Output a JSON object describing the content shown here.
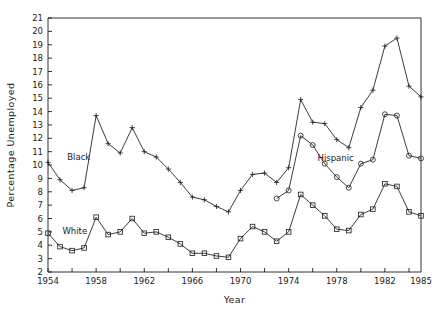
{
  "chart_data": {
    "type": "line",
    "title": "",
    "xlabel": "Year",
    "ylabel": "Percentage  Unemployed",
    "xlim": [
      1954,
      1985
    ],
    "ylim": [
      2,
      21
    ],
    "grid": false,
    "legend_position": "inline-annotations",
    "y_ticks": [
      2,
      3,
      4,
      5,
      6,
      7,
      8,
      9,
      10,
      11,
      12,
      13,
      14,
      15,
      16,
      17,
      18,
      19,
      20,
      21
    ],
    "x_ticks": [
      1954,
      1956,
      1958,
      1960,
      1962,
      1964,
      1966,
      1968,
      1970,
      1972,
      1974,
      1976,
      1978,
      1980,
      1982,
      1984
    ],
    "x_tick_labels": [
      "1954",
      "",
      "1958",
      "",
      "1962",
      "",
      "1966",
      "",
      "1970",
      "",
      "1974",
      "",
      "1978",
      "",
      "1982",
      ""
    ],
    "x_extra_labels": [
      {
        "x": 1985,
        "label": "1985"
      }
    ],
    "annotations": [
      {
        "text": "Black",
        "x": 1955.6,
        "y": 10.6
      },
      {
        "text": "White",
        "x": 1955.2,
        "y": 5.1
      },
      {
        "text": "Hispanic",
        "x": 1976.4,
        "y": 10.5
      }
    ],
    "series": [
      {
        "name": "Black",
        "marker": "plus",
        "x": [
          1954,
          1955,
          1956,
          1957,
          1958,
          1959,
          1960,
          1961,
          1962,
          1963,
          1964,
          1965,
          1966,
          1967,
          1968,
          1969,
          1970,
          1971,
          1972,
          1973,
          1974,
          1975,
          1976,
          1977,
          1978,
          1979,
          1980,
          1981,
          1982,
          1983,
          1984,
          1985
        ],
        "values": [
          10.2,
          8.9,
          8.1,
          8.3,
          13.7,
          11.6,
          10.9,
          12.8,
          11.0,
          10.6,
          9.7,
          8.7,
          7.6,
          7.4,
          6.9,
          6.5,
          8.1,
          9.3,
          9.4,
          8.7,
          9.8,
          14.9,
          13.2,
          13.1,
          11.9,
          11.3,
          14.3,
          15.6,
          18.9,
          19.5,
          15.9,
          15.1
        ]
      },
      {
        "name": "Hispanic",
        "marker": "circle",
        "x": [
          1973,
          1974,
          1975,
          1976,
          1977,
          1978,
          1979,
          1980,
          1981,
          1982,
          1983,
          1984,
          1985
        ],
        "values": [
          7.5,
          8.1,
          12.2,
          11.5,
          10.1,
          9.1,
          8.3,
          10.1,
          10.4,
          13.8,
          13.7,
          10.7,
          10.5
        ]
      },
      {
        "name": "White",
        "marker": "square",
        "x": [
          1954,
          1955,
          1956,
          1957,
          1958,
          1959,
          1960,
          1961,
          1962,
          1963,
          1964,
          1965,
          1966,
          1967,
          1968,
          1969,
          1970,
          1971,
          1972,
          1973,
          1974,
          1975,
          1976,
          1977,
          1978,
          1979,
          1980,
          1981,
          1982,
          1983,
          1984,
          1985
        ],
        "values": [
          4.9,
          3.9,
          3.6,
          3.8,
          6.1,
          4.8,
          5.0,
          6.0,
          4.9,
          5.0,
          4.6,
          4.1,
          3.4,
          3.4,
          3.2,
          3.1,
          4.5,
          5.4,
          5.0,
          4.3,
          5.0,
          7.8,
          7.0,
          6.2,
          5.2,
          5.1,
          6.3,
          6.7,
          8.6,
          8.4,
          6.5,
          6.2
        ]
      }
    ]
  }
}
